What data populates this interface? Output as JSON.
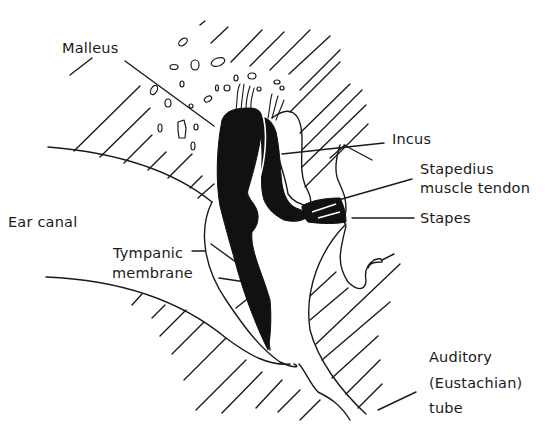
{
  "diagram": {
    "colors": {
      "background": "#ffffff",
      "ink": "#1a1a1a",
      "ossicle_fill": "#111111"
    },
    "labels": {
      "malleus": "Malleus",
      "incus": "Incus",
      "stapedius_line1": "Stapedius",
      "stapedius_line2": "muscle tendon",
      "stapes": "Stapes",
      "ear_canal": "Ear canal",
      "tympanic_line1": "Tympanic",
      "tympanic_line2": "membrane",
      "auditory_line1": "Auditory",
      "auditory_line2": "(Eustachian)",
      "auditory_line3": "tube"
    }
  }
}
